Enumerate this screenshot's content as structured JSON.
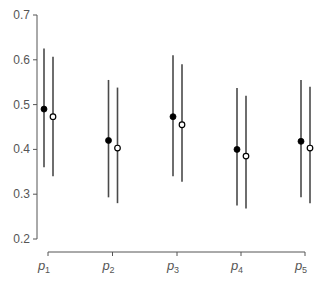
{
  "chart_data": {
    "type": "scatter",
    "subtype": "point-range (dot with interval)",
    "title": "",
    "xlabel": "",
    "ylabel": "",
    "categories": [
      "p1",
      "p2",
      "p3",
      "p4",
      "p5"
    ],
    "category_display": [
      {
        "base": "p",
        "sub": "1"
      },
      {
        "base": "p",
        "sub": "2"
      },
      {
        "base": "p",
        "sub": "3"
      },
      {
        "base": "p",
        "sub": "4"
      },
      {
        "base": "p",
        "sub": "5"
      }
    ],
    "ylim": [
      0.2,
      0.7
    ],
    "yticks": [
      "0.2",
      "0.3",
      "0.4",
      "0.5",
      "0.6",
      "0.7"
    ],
    "grid": false,
    "legend": null,
    "series": [
      {
        "name": "filled",
        "marker": "filled-circle",
        "color": "#000000",
        "values": [
          0.49,
          0.42,
          0.473,
          0.4,
          0.418
        ],
        "lower": [
          0.36,
          0.293,
          0.34,
          0.275,
          0.293
        ],
        "upper": [
          0.625,
          0.555,
          0.61,
          0.537,
          0.555
        ]
      },
      {
        "name": "open",
        "marker": "open-circle",
        "color": "#000000",
        "values": [
          0.473,
          0.403,
          0.455,
          0.385,
          0.403
        ],
        "lower": [
          0.34,
          0.28,
          0.328,
          0.268,
          0.28
        ],
        "upper": [
          0.607,
          0.538,
          0.59,
          0.52,
          0.54
        ]
      }
    ]
  },
  "colors": {
    "axis": "#555555",
    "bar": "#4a4a4a",
    "marker": "#000000",
    "background": "#ffffff"
  }
}
